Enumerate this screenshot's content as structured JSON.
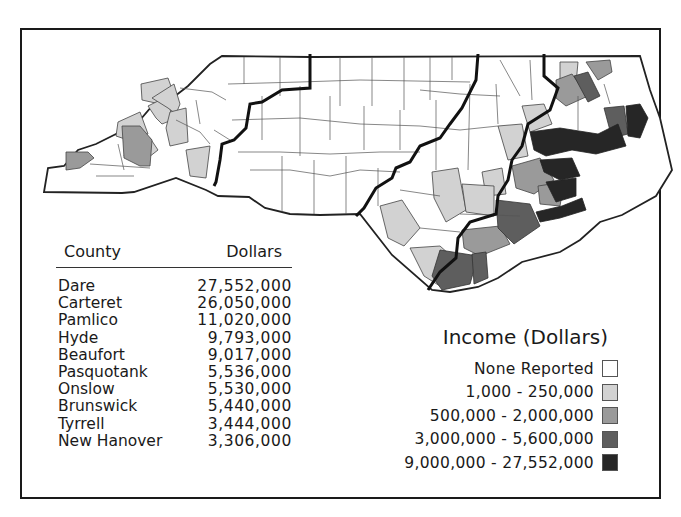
{
  "table": {
    "header": {
      "county": "County",
      "dollars": "Dollars"
    },
    "rows": [
      {
        "county": "Dare",
        "dollars": "27,552,000"
      },
      {
        "county": "Carteret",
        "dollars": "26,050,000"
      },
      {
        "county": "Pamlico",
        "dollars": "11,020,000"
      },
      {
        "county": "Hyde",
        "dollars": "9,793,000"
      },
      {
        "county": "Beaufort",
        "dollars": "9,017,000"
      },
      {
        "county": "Pasquotank",
        "dollars": "5,536,000"
      },
      {
        "county": "Onslow",
        "dollars": "5,530,000"
      },
      {
        "county": "Brunswick",
        "dollars": "5,440,000"
      },
      {
        "county": "Tyrrell",
        "dollars": "3,444,000"
      },
      {
        "county": "New Hanover",
        "dollars": "3,306,000"
      }
    ]
  },
  "legend": {
    "title": "Income (Dollars)",
    "items": [
      {
        "label": "None Reported",
        "color": "#ffffff"
      },
      {
        "label": "1,000 - 250,000",
        "color": "#d2d2d2"
      },
      {
        "label": "500,000 - 2,000,000",
        "color": "#9a9a9a"
      },
      {
        "label": "3,000,000 - 5,600,000",
        "color": "#5e5e5e"
      },
      {
        "label": "9,000,000 - 27,552,000",
        "color": "#262626"
      }
    ]
  },
  "map": {
    "region": "North Carolina",
    "colors": {
      "none": "#ffffff",
      "low": "#d2d2d2",
      "mid": "#9a9a9a",
      "high": "#5e5e5e",
      "top": "#262626",
      "line": "#333333"
    }
  }
}
